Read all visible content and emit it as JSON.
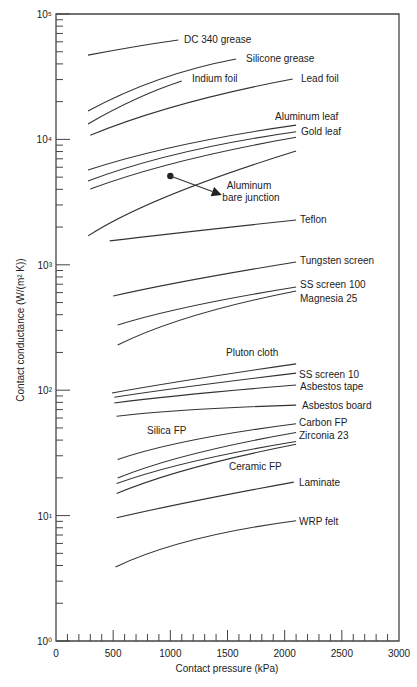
{
  "chart_data": {
    "type": "line",
    "title": "",
    "xlabel": "Contact pressure (kPa)",
    "ylabel": "Contact conductance (W/(m² K))",
    "xlim": [
      0,
      3000
    ],
    "ylim": [
      1,
      100000
    ],
    "yscale": "log",
    "grid": false,
    "legend": "inline labels",
    "x_ticks": [
      0,
      500,
      1000,
      1500,
      2000,
      2500,
      3000
    ],
    "x_tick_labels": [
      "0",
      "500",
      "1000",
      "1500",
      "2000",
      "2500",
      "3000"
    ],
    "y_ticks": [
      1,
      10,
      100,
      1000,
      10000,
      100000
    ],
    "y_tick_labels": [
      "10⁰",
      "10¹",
      "10²",
      "10³",
      "10⁴",
      "10⁵"
    ],
    "series": [
      {
        "name": "DC 340 grease",
        "x": [
          280,
          700,
          1070
        ],
        "y": [
          47000,
          55000,
          62000
        ]
      },
      {
        "name": "Silicone grease",
        "x": [
          280,
          900,
          1575
        ],
        "y": [
          16800,
          30000,
          43800
        ]
      },
      {
        "name": "Indium foil",
        "x": [
          280,
          700,
          1100
        ],
        "y": [
          13300,
          21000,
          29200
        ]
      },
      {
        "name": "Lead foil",
        "x": [
          300,
          1100,
          2070
        ],
        "y": [
          10800,
          19000,
          30300
        ]
      },
      {
        "name": "Aluminum leaf",
        "x": [
          280,
          1100,
          2100
        ],
        "y": [
          5700,
          9000,
          13000
        ]
      },
      {
        "name": "Gold leaf",
        "x": [
          280,
          1100,
          2100
        ],
        "y": [
          4660,
          7800,
          11500
        ]
      },
      {
        "name": "Gold leaf (lower)",
        "x": [
          300,
          1100,
          2100
        ],
        "y": [
          4020,
          6700,
          10400
        ]
      },
      {
        "name": "Aluminum bare junction",
        "x": [
          280,
          1000,
          2100
        ],
        "y": [
          1700,
          3600,
          8080
        ]
      },
      {
        "name": "Teflon",
        "x": [
          470,
          1200,
          2100
        ],
        "y": [
          1550,
          1850,
          2275
        ]
      },
      {
        "name": "Tungsten screen",
        "x": [
          500,
          1200,
          2100
        ],
        "y": [
          564,
          760,
          1052
        ]
      },
      {
        "name": "SS screen 100",
        "x": [
          540,
          1200,
          2100
        ],
        "y": [
          331,
          470,
          665
        ]
      },
      {
        "name": "Magnesia 25",
        "x": [
          540,
          1200,
          2100
        ],
        "y": [
          229,
          390,
          618
        ]
      },
      {
        "name": "Pluton cloth",
        "x": [
          490,
          1200,
          2100
        ],
        "y": [
          95,
          122,
          162
        ]
      },
      {
        "name": "SS screen 10",
        "x": [
          510,
          1200,
          2100
        ],
        "y": [
          88,
          108,
          137
        ]
      },
      {
        "name": "Asbestos tape",
        "x": [
          510,
          1200,
          2100
        ],
        "y": [
          79,
          93,
          110
        ]
      },
      {
        "name": "Asbestos board",
        "x": [
          530,
          1200,
          2100
        ],
        "y": [
          62,
          70,
          76
        ]
      },
      {
        "name": "Carbon FP",
        "x": [
          540,
          1200,
          2100
        ],
        "y": [
          28,
          40,
          54
        ]
      },
      {
        "name": "Zirconia 23",
        "x": [
          540,
          1200,
          2100
        ],
        "y": [
          20,
          31,
          46
        ]
      },
      {
        "name": "Ceramic FP",
        "x": [
          530,
          1200,
          2100
        ],
        "y": [
          18,
          27,
          39
        ]
      },
      {
        "name": "Ceramic FP (lower)",
        "x": [
          530,
          1200,
          2100
        ],
        "y": [
          15,
          24,
          37
        ]
      },
      {
        "name": "Laminate",
        "x": [
          530,
          1200,
          2080
        ],
        "y": [
          9.6,
          13,
          18.5
        ]
      },
      {
        "name": "WRP felt",
        "x": [
          520,
          1200,
          2100
        ],
        "y": [
          3.9,
          6.4,
          9.1
        ]
      }
    ],
    "annotations": [
      {
        "text": "Aluminum bare junction",
        "type": "arrow",
        "from": [
          1000,
          5100
        ],
        "to": [
          1450,
          3600
        ]
      }
    ]
  },
  "labels": [
    {
      "text": "DC 340 grease",
      "x": 184,
      "y": 43,
      "anchor": "start"
    },
    {
      "text": "Silicone grease",
      "x": 246,
      "y": 62,
      "anchor": "start"
    },
    {
      "text": "Indium foil",
      "x": 192,
      "y": 82,
      "anchor": "start"
    },
    {
      "text": "Lead foil",
      "x": 301,
      "y": 82,
      "anchor": "start"
    },
    {
      "text": "Aluminum leaf",
      "x": 275,
      "y": 120,
      "anchor": "start"
    },
    {
      "text": "Gold leaf",
      "x": 301,
      "y": 135,
      "anchor": "start"
    },
    {
      "text": "Aluminum",
      "x": 249,
      "y": 189,
      "anchor": "middle"
    },
    {
      "text": "bare junction",
      "x": 251,
      "y": 201,
      "anchor": "middle"
    },
    {
      "text": "Teflon",
      "x": 300,
      "y": 223,
      "anchor": "start"
    },
    {
      "text": "Tungsten screen",
      "x": 300,
      "y": 264,
      "anchor": "start"
    },
    {
      "text": "SS screen 100",
      "x": 300,
      "y": 288,
      "anchor": "start"
    },
    {
      "text": "Magnesia 25",
      "x": 300,
      "y": 302,
      "anchor": "start"
    },
    {
      "text": "Pluton cloth",
      "x": 226,
      "y": 356,
      "anchor": "start"
    },
    {
      "text": "SS screen 10",
      "x": 299,
      "y": 378,
      "anchor": "start"
    },
    {
      "text": "Asbestos tape",
      "x": 300,
      "y": 390,
      "anchor": "start"
    },
    {
      "text": "Asbestos board",
      "x": 302,
      "y": 409,
      "anchor": "start"
    },
    {
      "text": "Silica FP",
      "x": 147,
      "y": 434,
      "anchor": "start"
    },
    {
      "text": "Carbon FP",
      "x": 299,
      "y": 426,
      "anchor": "start"
    },
    {
      "text": "Zirconia 23",
      "x": 299,
      "y": 439,
      "anchor": "start"
    },
    {
      "text": "Ceramic FP",
      "x": 229,
      "y": 470,
      "anchor": "start"
    },
    {
      "text": "Laminate",
      "x": 299,
      "y": 486,
      "anchor": "start"
    },
    {
      "text": "WRP felt",
      "x": 299,
      "y": 525,
      "anchor": "start"
    }
  ]
}
